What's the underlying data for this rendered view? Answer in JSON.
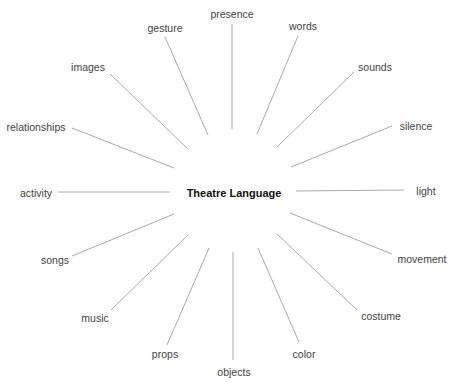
{
  "diagram": {
    "title": "Theatre Language",
    "center": {
      "label": "Theatre Language",
      "x": 234,
      "y": 193
    },
    "line_color": "#aaaaaa",
    "text_color": "#444444",
    "nodes": [
      {
        "label": "presence",
        "lx": 232,
        "ly": 14,
        "x1": 232,
        "y1": 24,
        "x2": 232,
        "y2": 129
      },
      {
        "label": "words",
        "lx": 303,
        "ly": 26,
        "x1": 298,
        "y1": 36,
        "x2": 257,
        "y2": 134
      },
      {
        "label": "sounds",
        "lx": 375,
        "ly": 67,
        "x1": 354,
        "y1": 72,
        "x2": 277,
        "y2": 147
      },
      {
        "label": "silence",
        "lx": 416,
        "ly": 126,
        "x1": 392,
        "y1": 126,
        "x2": 291,
        "y2": 167
      },
      {
        "label": "light",
        "lx": 426,
        "ly": 191,
        "x1": 404,
        "y1": 190,
        "x2": 296,
        "y2": 191
      },
      {
        "label": "movement",
        "lx": 422,
        "ly": 259,
        "x1": 392,
        "y1": 254,
        "x2": 290,
        "y2": 213
      },
      {
        "label": "costume",
        "lx": 381,
        "ly": 316,
        "x1": 357,
        "y1": 310,
        "x2": 277,
        "y2": 234
      },
      {
        "label": "color",
        "lx": 304,
        "ly": 354,
        "x1": 299,
        "y1": 342,
        "x2": 258,
        "y2": 248
      },
      {
        "label": "objects",
        "lx": 234,
        "ly": 372,
        "x1": 233,
        "y1": 360,
        "x2": 233,
        "y2": 252
      },
      {
        "label": "props",
        "lx": 165,
        "ly": 354,
        "x1": 167,
        "y1": 345,
        "x2": 209,
        "y2": 248
      },
      {
        "label": "music",
        "lx": 95,
        "ly": 318,
        "x1": 111,
        "y1": 310,
        "x2": 188,
        "y2": 235
      },
      {
        "label": "songs",
        "lx": 55,
        "ly": 260,
        "x1": 72,
        "y1": 256,
        "x2": 174,
        "y2": 214
      },
      {
        "label": "activity",
        "lx": 36,
        "ly": 193,
        "x1": 58,
        "y1": 192,
        "x2": 170,
        "y2": 192
      },
      {
        "label": "relationships",
        "lx": 36,
        "ly": 127,
        "x1": 72,
        "y1": 128,
        "x2": 174,
        "y2": 168
      },
      {
        "label": "images",
        "lx": 88,
        "ly": 67,
        "x1": 110,
        "y1": 74,
        "x2": 188,
        "y2": 149
      },
      {
        "label": "gesture",
        "lx": 165,
        "ly": 28,
        "x1": 165,
        "y1": 37,
        "x2": 208,
        "y2": 135
      }
    ]
  }
}
